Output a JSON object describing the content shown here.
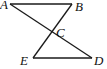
{
  "diagram": {
    "title": "",
    "points": {
      "A": {
        "label": "A",
        "x": 10,
        "y": 4
      },
      "B": {
        "label": "B",
        "x": 72,
        "y": 4
      },
      "C": {
        "label": "C",
        "x": 52,
        "y": 31
      },
      "D": {
        "label": "D",
        "x": 92,
        "y": 58
      },
      "E": {
        "label": "E",
        "x": 33,
        "y": 58
      }
    },
    "segments": [
      {
        "from": "A",
        "to": "B"
      },
      {
        "from": "E",
        "to": "D"
      },
      {
        "from": "A",
        "to": "D"
      },
      {
        "from": "B",
        "to": "E"
      }
    ],
    "colors": {
      "line": "#1a1a1a",
      "label": "#111111",
      "background": "#ffffff"
    }
  }
}
